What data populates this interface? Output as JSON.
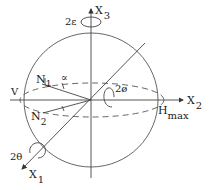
{
  "diagram": {
    "title": "",
    "axes": {
      "x1": {
        "main": "X",
        "sub": "1"
      },
      "x2": {
        "main": "X",
        "sub": "2"
      },
      "x3": {
        "main": "X",
        "sub": "3"
      }
    },
    "points": {
      "n1": {
        "main": "N",
        "sub": "1"
      },
      "n2": {
        "main": "N",
        "sub": "2"
      },
      "v": "V",
      "hmax": {
        "main": "H",
        "sub": "max"
      }
    },
    "angles": {
      "epsilon": "2ε",
      "phi": "2ø",
      "theta": "2θ",
      "alpha": "∝"
    },
    "colors": {
      "line": "#444444",
      "text": "#222222",
      "background": "#ffffff"
    }
  }
}
